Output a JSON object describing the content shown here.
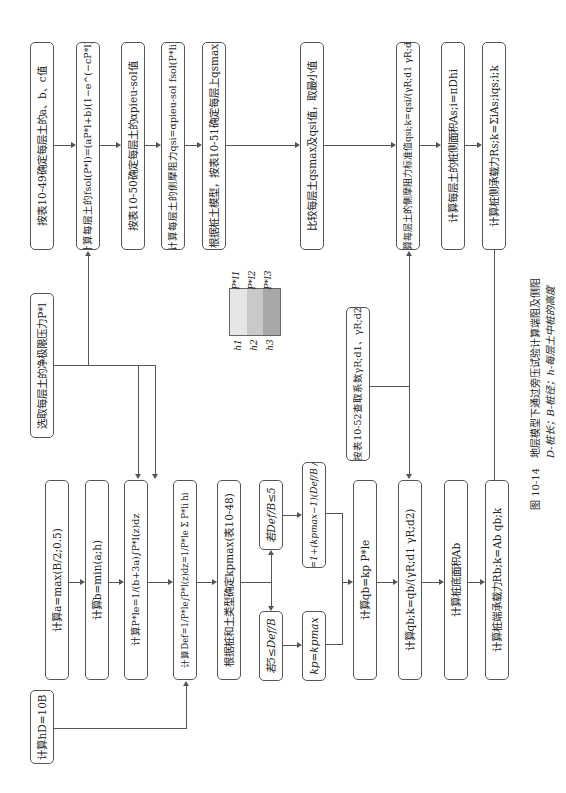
{
  "figure": {
    "caption_title": "图 10-14　地层模型下通过旁压试验计算端阻及侧阻",
    "caption_note": "D-桩长；B-桩径；h-每层土中桩的高度"
  },
  "start": {
    "label": "选取每层土的净极限压力P*l"
  },
  "side_friction_branch": [
    {
      "label": "按表10-49确定每层土的a、b、c值"
    },
    {
      "label": "计算每层土的fsol(P*l)=(aP*l+b)(1−e^(−cP*l))"
    },
    {
      "label": "按表10-50确定每层土的αpieu-sol值"
    },
    {
      "label": "计算每层土的侧摩阻力qsi=αpieu-sol fsol(P*li)"
    },
    {
      "label": "根据桩土模型，按表10-51确定每层上qsmax"
    },
    {
      "label": "比较每层土qsmax及qsi值，取最小值"
    },
    {
      "label": "计算每层土的侧摩阻力标准值qsi;k=qsi/(γR;d1 γR;d2)"
    },
    {
      "label": "计算每层土的桩侧面积As;i=πDhi"
    },
    {
      "label": "计算桩侧承载力Rs;k=ΣiAs;iqs;i;k"
    }
  ],
  "end_bearing_branch": [
    {
      "label": "计算a=max(B/2;0.5)"
    },
    {
      "label": "计算b=min(a;h)"
    },
    {
      "label": "计算P*le=1/(b+3a)∫P*l(z)dz"
    },
    {
      "label": "计算Def=1/P*le∫P*l(z)dz=1/P*le Σ P*li hi"
    },
    {
      "label": "根据桩和土类型确定kpmax(表10-48)"
    },
    {
      "label": "计算qb=kp P*le"
    },
    {
      "label": "计算qb;k=qb/(γR;d1 γR;d2)"
    },
    {
      "label": "计算桩底面积Ab"
    },
    {
      "label": "计算桩端承载力Rb;k=Ab qb;k"
    }
  ],
  "conditions": {
    "deep": {
      "label": "若5≤Def/B",
      "result": "kp=kpmax"
    },
    "shallow": {
      "label": "若Def/B≤5",
      "result": "kp=1+(kpmax−1)(Def/B / 5)"
    }
  },
  "hd_box": {
    "label": "计算hD=10B"
  },
  "gamma_box": {
    "label": "按表10-52查取系数γR;d1、γR;d2"
  },
  "legend": {
    "layers": [
      "h1",
      "h2",
      "h3"
    ],
    "pressures": [
      "P*l1",
      "P*l2",
      "P*l3"
    ]
  }
}
